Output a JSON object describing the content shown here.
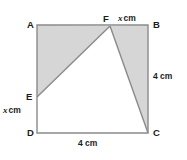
{
  "figure": {
    "shape": "square",
    "stroke_color": "#8a8a8a",
    "shade_color": "#d6d6d6",
    "white_fill": "#ffffff",
    "label_color": "#1b1b1b",
    "square": {
      "A": {
        "x": 37,
        "y": 25
      },
      "B": {
        "x": 148,
        "y": 25
      },
      "C": {
        "x": 148,
        "y": 133
      },
      "D": {
        "x": 37,
        "y": 133
      }
    },
    "points": {
      "E": {
        "x": 37,
        "y": 97,
        "on_edge": "AD"
      },
      "F": {
        "x": 110,
        "y": 26,
        "on_edge": "AB"
      }
    },
    "shaded_triangles": [
      {
        "name": "triangle-AEF",
        "vertices": "37,25 37,97 110,26"
      },
      {
        "name": "triangle-FBC",
        "vertices": "110,26 148,25 148,133"
      }
    ],
    "white_triangle": {
      "name": "triangle-EFC",
      "vertices": "37,97 110,26 148,133"
    }
  },
  "labels": {
    "vertex_A": "A",
    "vertex_B": "B",
    "vertex_C": "C",
    "vertex_D": "D",
    "vertex_E": "E",
    "vertex_F": "F",
    "var_symbol": "x",
    "unit": "cm",
    "side_right": "4 cm",
    "side_bottom": "4 cm"
  }
}
